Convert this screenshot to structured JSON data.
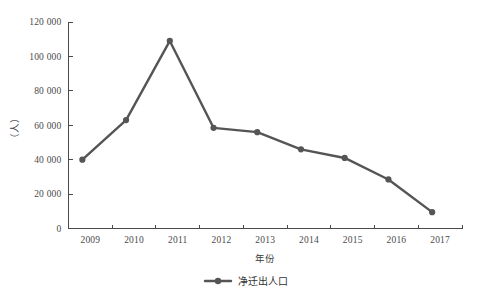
{
  "chart_data": {
    "type": "line",
    "title": "",
    "subtitle": "",
    "xlabel": "年份",
    "ylabel": "（人）",
    "categories": [
      "2009",
      "2010",
      "2011",
      "2012",
      "2013",
      "2014",
      "2015",
      "2016",
      "2017"
    ],
    "series": [
      {
        "name": "净迁出人口",
        "values": [
          40000,
          63000,
          109000,
          58500,
          56000,
          46000,
          41000,
          28500,
          9500
        ]
      }
    ],
    "ylim": [
      0,
      120000
    ],
    "ytick_values": [
      0,
      20000,
      40000,
      60000,
      80000,
      100000,
      120000
    ],
    "ytick_labels": [
      "0",
      "20 000",
      "40 000",
      "60 000",
      "80 000",
      "100 000",
      "120 000"
    ],
    "grid": false,
    "legend_position": "bottom",
    "legend": [
      {
        "label": "净迁出人口",
        "color": "#555555",
        "marker": "circle"
      }
    ],
    "colors": {
      "series": "#555555",
      "axis": "#4a4a4a",
      "text": "#3a3a3a",
      "background": "#ffffff"
    }
  }
}
